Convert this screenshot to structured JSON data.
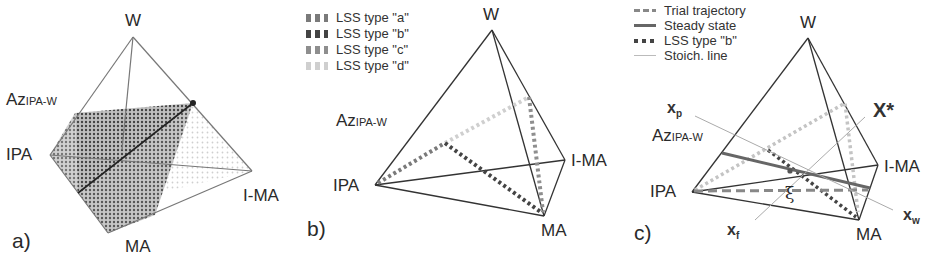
{
  "figure": {
    "panels": [
      {
        "id": "a",
        "label": "a)",
        "vertices": {
          "top": "W",
          "left_upper": "Az",
          "left_upper_sub": "IPA-W",
          "left": "IPA",
          "right": "I-MA",
          "bottom": "MA"
        }
      },
      {
        "id": "b",
        "label": "b)",
        "vertices": {
          "top": "W",
          "left_upper": "Az",
          "left_upper_sub": "IPA-W",
          "left": "IPA",
          "right": "I-MA",
          "bottom": "MA"
        },
        "legend": [
          {
            "label": "LSS type \"a\"",
            "color": "#7a7a7a"
          },
          {
            "label": "LSS type \"b\"",
            "color": "#444444"
          },
          {
            "label": "LSS type \"c\"",
            "color": "#8e8e8e"
          },
          {
            "label": "LSS type \"d\"",
            "color": "#cfcfcf"
          }
        ]
      },
      {
        "id": "c",
        "label": "c)",
        "vertices": {
          "top": "W",
          "left_upper": "Az",
          "left_upper_sub": "IPA-W",
          "left": "IPA",
          "right": "I-MA",
          "bottom": "MA"
        },
        "legend": [
          {
            "label": "Trial trajectory",
            "style": "dashed",
            "color": "#888888"
          },
          {
            "label": "Steady state",
            "style": "solid",
            "color": "#666666"
          },
          {
            "label": "LSS type \"b\"",
            "style": "dotted",
            "color": "#444444"
          },
          {
            "label": "Stoich. line",
            "style": "thin",
            "color": "#bbbbbb"
          }
        ],
        "annotations": {
          "xp": "x",
          "xp_sub": "p",
          "xstar": "X*",
          "xw": "x",
          "xw_sub": "w",
          "xf": "x",
          "xf_sub": "f",
          "xi": "ξ"
        }
      }
    ]
  }
}
